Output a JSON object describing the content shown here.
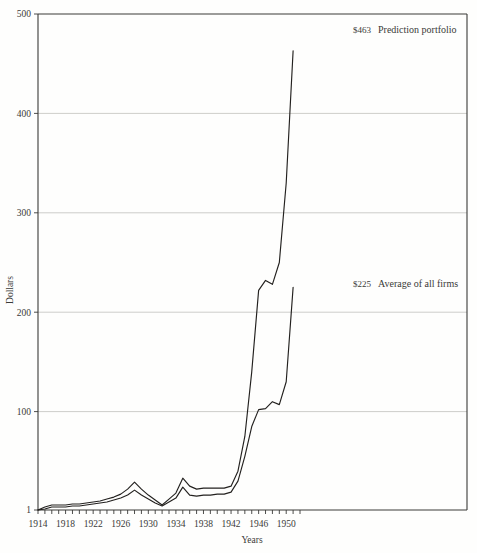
{
  "figure": {
    "background_color": "#fefefd",
    "line_color": "#23211f",
    "grid_color": "#b9b9b4",
    "axis_color": "#3a3a38"
  },
  "chart_data": {
    "type": "line",
    "title": "",
    "xlabel": "Years",
    "ylabel": "Dollars",
    "xlim": [
      1914,
      1952
    ],
    "ylim": [
      1,
      500
    ],
    "grid": true,
    "gridlines_y": [
      100,
      200,
      300,
      400
    ],
    "legend_position": "inline-annotation",
    "y_ticks": [
      1,
      100,
      200,
      300,
      400,
      500
    ],
    "y_tick_labels": [
      "1",
      "100",
      "200",
      "300",
      "400",
      "500"
    ],
    "x_ticks": [
      1914,
      1915,
      1916,
      1917,
      1918,
      1919,
      1920,
      1921,
      1922,
      1923,
      1924,
      1925,
      1926,
      1927,
      1928,
      1929,
      1930,
      1931,
      1932,
      1933,
      1934,
      1935,
      1936,
      1937,
      1938,
      1939,
      1940,
      1941,
      1942,
      1943,
      1944,
      1945,
      1946,
      1947,
      1948,
      1949,
      1950,
      1951,
      1952
    ],
    "x_tick_labels_shown": [
      "1914",
      "1918",
      "1922",
      "1926",
      "1930",
      "1934",
      "1938",
      "1942",
      "1946",
      "1950"
    ],
    "x_tick_labels_years": [
      1914,
      1918,
      1922,
      1926,
      1930,
      1934,
      1938,
      1942,
      1946,
      1950
    ],
    "annotations": [
      {
        "id": "prediction-portfolio",
        "amount": "$463",
        "text": "Prediction portfolio",
        "value": 463,
        "year": 1951
      },
      {
        "id": "average-of-all-firms",
        "amount": "$225",
        "text": "Average of all firms",
        "value": 225,
        "year": 1951
      }
    ],
    "series": [
      {
        "name": "Prediction portfolio",
        "x": [
          1914,
          1915,
          1916,
          1917,
          1918,
          1919,
          1920,
          1921,
          1922,
          1923,
          1924,
          1925,
          1926,
          1927,
          1928,
          1929,
          1930,
          1931,
          1932,
          1933,
          1934,
          1935,
          1936,
          1937,
          1938,
          1939,
          1940,
          1941,
          1942,
          1943,
          1944,
          1945,
          1946,
          1947,
          1948,
          1949,
          1950,
          1951
        ],
        "values": [
          1,
          4,
          6,
          6,
          6,
          7,
          7,
          8,
          9,
          10,
          12,
          14,
          17,
          22,
          29,
          22,
          16,
          11,
          6,
          12,
          18,
          33,
          25,
          22,
          23,
          23,
          23,
          23,
          25,
          40,
          75,
          140,
          222,
          232,
          228,
          250,
          330,
          463
        ]
      },
      {
        "name": "Average of all firms",
        "x": [
          1914,
          1915,
          1916,
          1917,
          1918,
          1919,
          1920,
          1921,
          1922,
          1923,
          1924,
          1925,
          1926,
          1927,
          1928,
          1929,
          1930,
          1931,
          1932,
          1933,
          1934,
          1935,
          1936,
          1937,
          1938,
          1939,
          1940,
          1941,
          1942,
          1943,
          1944,
          1945,
          1946,
          1947,
          1948,
          1949,
          1950,
          1951
        ],
        "values": [
          1,
          2,
          4,
          4,
          4,
          5,
          5,
          6,
          7,
          8,
          9,
          11,
          13,
          16,
          21,
          16,
          12,
          8,
          5,
          9,
          13,
          24,
          16,
          15,
          16,
          16,
          17,
          17,
          19,
          30,
          55,
          85,
          102,
          103,
          110,
          107,
          130,
          225
        ]
      }
    ]
  }
}
